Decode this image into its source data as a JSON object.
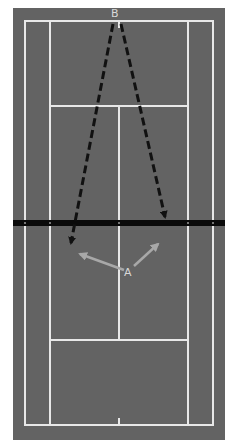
{
  "diagram": {
    "colors": {
      "page_background": "#ffffff",
      "court_surface": "#636363",
      "court_lines": "#e8e8e8",
      "net": "#0a0a0a",
      "dashed_arrows": "#111111",
      "player_a_arrows": "#a8a8a8",
      "labels": "#d8d8d8"
    },
    "players": [
      {
        "id": "B",
        "label": "B",
        "x": 115,
        "y": 13
      },
      {
        "id": "A",
        "label": "A",
        "x": 128,
        "y": 274
      }
    ],
    "shots_from_B": [
      {
        "from": "B",
        "to_x": 70,
        "to_y": 245,
        "style": "dashed"
      },
      {
        "from": "B",
        "to_x": 166,
        "to_y": 219,
        "style": "dashed"
      }
    ],
    "movements_of_A": [
      {
        "from": "A",
        "to_x": 78,
        "to_y": 253,
        "style": "solid"
      },
      {
        "from": "A",
        "to_x": 160,
        "to_y": 242,
        "style": "solid"
      }
    ]
  }
}
